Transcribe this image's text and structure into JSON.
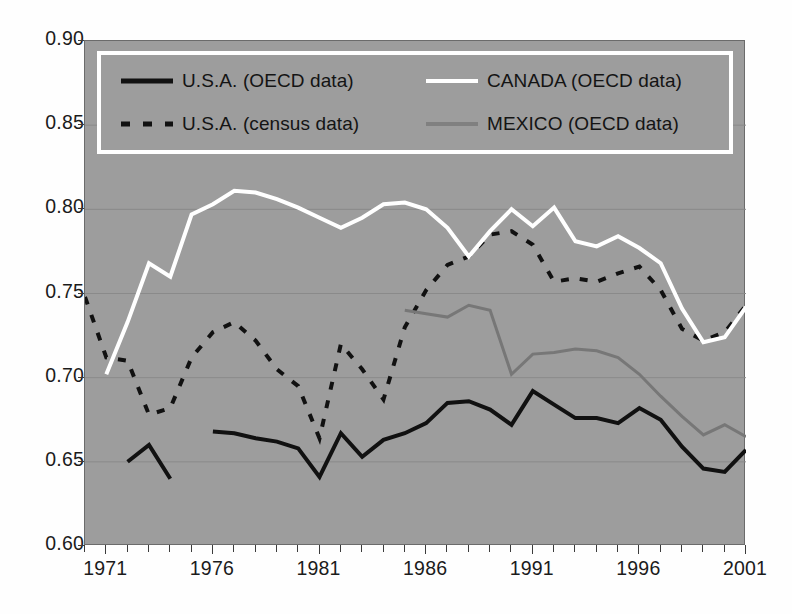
{
  "chart_data": {
    "type": "line",
    "title": "",
    "xlabel": "",
    "ylabel": "",
    "xlim": [
      1970,
      2001
    ],
    "ylim": [
      0.6,
      0.9
    ],
    "grid": true,
    "legend_position": "top-inside",
    "plot_background": "#9d9d9d",
    "x_ticks": [
      1971,
      1976,
      1981,
      1986,
      1991,
      1996,
      2001
    ],
    "x_tick_labels": [
      "1971",
      "1976",
      "1981",
      "1986",
      "1991",
      "1996",
      "2001"
    ],
    "x_minor_step": 1,
    "y_ticks": [
      0.6,
      0.65,
      0.7,
      0.75,
      0.8,
      0.85,
      0.9
    ],
    "y_tick_labels": [
      "0.60",
      "0.65",
      "0.70",
      "0.75",
      "0.80",
      "0.85",
      "0.90"
    ],
    "series": [
      {
        "name": "U.S.A. (OECD data)",
        "style": "solid",
        "color": "#111111",
        "width": 4,
        "x": [
          1972,
          1973,
          1974,
          1976,
          1977,
          1978,
          1979,
          1980,
          1981,
          1982,
          1983,
          1984,
          1985,
          1986,
          1987,
          1988,
          1989,
          1990,
          1991,
          1992,
          1993,
          1994,
          1995,
          1996,
          1997,
          1998,
          1999,
          2000,
          2001
        ],
        "values": [
          0.65,
          0.66,
          0.64,
          0.668,
          0.667,
          0.664,
          0.662,
          0.658,
          0.641,
          0.667,
          0.653,
          0.663,
          0.667,
          0.673,
          0.685,
          0.686,
          0.681,
          0.672,
          0.692,
          0.684,
          0.676,
          0.676,
          0.673,
          0.682,
          0.675,
          0.659,
          0.646,
          0.644,
          0.657
        ],
        "gap_after": 1974
      },
      {
        "name": "U.S.A. (census data)",
        "style": "dashed",
        "color": "#111111",
        "width": 4,
        "x": [
          1970,
          1971,
          1972,
          1973,
          1974,
          1975,
          1976,
          1977,
          1978,
          1979,
          1980,
          1981,
          1982,
          1983,
          1984,
          1985,
          1986,
          1987,
          1988,
          1989,
          1990,
          1991,
          1992,
          1993,
          1994,
          1995,
          1996,
          1997,
          1998,
          1999,
          2000,
          2001
        ],
        "values": [
          0.748,
          0.712,
          0.71,
          0.678,
          0.682,
          0.712,
          0.727,
          0.733,
          0.722,
          0.705,
          0.695,
          0.664,
          0.72,
          0.705,
          0.687,
          0.73,
          0.752,
          0.767,
          0.772,
          0.785,
          0.787,
          0.779,
          0.757,
          0.759,
          0.757,
          0.762,
          0.766,
          0.752,
          0.729,
          0.722,
          0.727,
          0.743
        ]
      },
      {
        "name": "CANADA (OECD data)",
        "style": "solid",
        "color": "#ffffff",
        "width": 4,
        "x": [
          1971,
          1972,
          1973,
          1974,
          1975,
          1976,
          1977,
          1978,
          1979,
          1980,
          1981,
          1982,
          1983,
          1984,
          1985,
          1986,
          1987,
          1988,
          1989,
          1990,
          1991,
          1992,
          1993,
          1994,
          1995,
          1996,
          1997,
          1998,
          1999,
          2000,
          2001
        ],
        "values": [
          0.702,
          0.733,
          0.768,
          0.76,
          0.797,
          0.803,
          0.811,
          0.81,
          0.806,
          0.801,
          0.795,
          0.789,
          0.795,
          0.803,
          0.804,
          0.8,
          0.789,
          0.772,
          0.787,
          0.8,
          0.79,
          0.801,
          0.781,
          0.778,
          0.784,
          0.777,
          0.768,
          0.741,
          0.721,
          0.724,
          0.742
        ]
      },
      {
        "name": "MEXICO (OECD data)",
        "style": "solid",
        "color": "#777777",
        "width": 3,
        "x": [
          1985,
          1986,
          1987,
          1988,
          1989,
          1990,
          1991,
          1992,
          1993,
          1994,
          1995,
          1996,
          1997,
          1998,
          1999,
          2000,
          2001
        ],
        "values": [
          0.74,
          0.738,
          0.736,
          0.743,
          0.74,
          0.702,
          0.714,
          0.715,
          0.717,
          0.716,
          0.712,
          0.702,
          0.689,
          0.677,
          0.666,
          0.672,
          0.665
        ]
      }
    ]
  },
  "legend": {
    "entries": [
      {
        "label": "U.S.A. (OECD data)",
        "style": "solid",
        "color": "#111111",
        "icon": "solid-line-swatch-icon"
      },
      {
        "label": "U.S.A. (census data)",
        "style": "dashed",
        "color": "#111111",
        "icon": "dashed-line-swatch-icon"
      },
      {
        "label": "CANADA (OECD data)",
        "style": "solid",
        "color": "#ffffff",
        "icon": "solid-line-swatch-icon"
      },
      {
        "label": "MEXICO (OECD data)",
        "style": "solid",
        "color": "#777777",
        "icon": "solid-line-swatch-icon"
      }
    ]
  }
}
